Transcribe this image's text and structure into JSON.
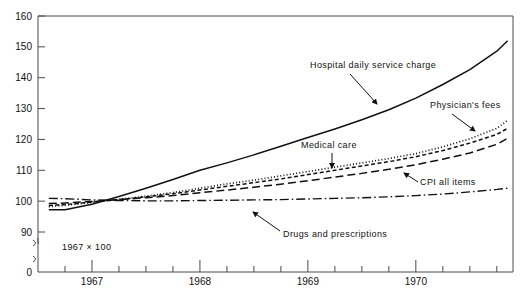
{
  "chart_data": {
    "type": "line",
    "title": "",
    "subtitle": "",
    "xlabel": "",
    "ylabel": "",
    "note": "1967 × 100",
    "grid": false,
    "legend_position": "inline-annotations",
    "xlim": [
      1966.5,
      1970.9
    ],
    "ylim": [
      85,
      160
    ],
    "y_axis_break": true,
    "y_ticks": [
      90,
      100,
      110,
      120,
      130,
      140,
      150,
      160
    ],
    "y_tick_labels": [
      "90",
      "100",
      "110",
      "120",
      "130",
      "140",
      "150",
      "160"
    ],
    "y_zero_label": "0",
    "x_ticks_major": [
      1967,
      1968,
      1969,
      1970
    ],
    "x_tick_labels": [
      "1967",
      "1968",
      "1969",
      "1970"
    ],
    "x_ticks_minor": [
      1966.75,
      1967.25,
      1967.5,
      1967.75,
      1968.25,
      1968.5,
      1968.75,
      1969.25,
      1969.5,
      1969.75,
      1970.25,
      1970.5,
      1970.75
    ],
    "x": [
      1966.6,
      1966.75,
      1967.0,
      1967.25,
      1967.5,
      1967.75,
      1968.0,
      1968.25,
      1968.5,
      1968.75,
      1969.0,
      1969.25,
      1969.5,
      1969.75,
      1970.0,
      1970.25,
      1970.5,
      1970.75,
      1970.85
    ],
    "series": [
      {
        "name": "Hospital daily service charge",
        "style": "solid",
        "values": [
          97.2,
          97.2,
          99.0,
          101.5,
          104.2,
          107.0,
          110.0,
          112.4,
          115.0,
          117.8,
          120.6,
          123.4,
          126.4,
          129.6,
          133.4,
          137.8,
          142.6,
          148.6,
          152.0
        ]
      },
      {
        "name": "Physician's fees",
        "style": "dotted",
        "values": [
          98.2,
          98.6,
          99.6,
          100.6,
          101.6,
          102.8,
          104.2,
          105.6,
          106.8,
          108.2,
          109.6,
          111.0,
          112.4,
          113.8,
          115.4,
          117.6,
          120.2,
          123.6,
          126.2
        ]
      },
      {
        "name": "Medical care",
        "style": "dashed-fine",
        "values": [
          98.6,
          98.9,
          99.7,
          100.5,
          101.4,
          102.4,
          103.6,
          104.8,
          106.0,
          107.2,
          108.6,
          110.0,
          111.4,
          112.8,
          114.4,
          116.4,
          118.8,
          121.6,
          123.6
        ]
      },
      {
        "name": "CPI all items",
        "style": "dashed",
        "values": [
          99.2,
          99.4,
          99.9,
          100.5,
          101.1,
          101.8,
          102.7,
          103.6,
          104.5,
          105.5,
          106.6,
          107.8,
          109.0,
          110.3,
          111.8,
          113.6,
          115.6,
          118.4,
          120.4
        ]
      },
      {
        "name": "Drugs and prescriptions",
        "style": "dash-dot",
        "values": [
          100.9,
          100.8,
          100.4,
          100.2,
          100.1,
          100.1,
          100.2,
          100.3,
          100.4,
          100.5,
          100.7,
          100.9,
          101.1,
          101.4,
          101.8,
          102.3,
          103.0,
          103.8,
          104.2
        ]
      }
    ],
    "annotations": [
      {
        "label": "Hospital daily service charge",
        "text_x": 310,
        "text_y": 68,
        "arrow_from_x": 350,
        "arrow_from_y": 74,
        "arrow_to_x": 377,
        "arrow_to_y": 104
      },
      {
        "label": "Physician's fees",
        "text_x": 430,
        "text_y": 108,
        "arrow_from_x": 452,
        "arrow_from_y": 114,
        "arrow_to_x": 475,
        "arrow_to_y": 131
      },
      {
        "label": "Medical care",
        "text_x": 301,
        "text_y": 148,
        "arrow_from_x": 332,
        "arrow_from_y": 153,
        "arrow_to_x": 332,
        "arrow_to_y": 168
      },
      {
        "label": "CPI all items",
        "text_x": 420,
        "text_y": 185,
        "arrow_from_x": 418,
        "arrow_from_y": 182,
        "arrow_to_x": 404,
        "arrow_to_y": 173
      },
      {
        "label": "Drugs and prescriptions",
        "text_x": 283,
        "text_y": 237,
        "arrow_from_x": 280,
        "arrow_from_y": 231,
        "arrow_to_x": 253,
        "arrow_to_y": 212
      }
    ]
  },
  "colors": {
    "axis": "#4a4a4a",
    "line": "#111111",
    "text": "#111111",
    "background": "#ffffff"
  }
}
